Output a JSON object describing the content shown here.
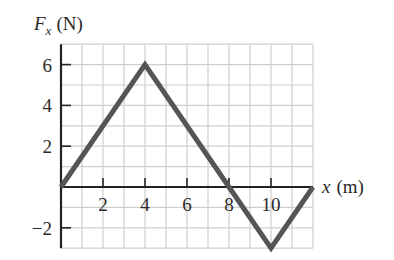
{
  "chart_data": {
    "type": "line",
    "title": "",
    "xlabel": "x (m)",
    "ylabel": "F_x (N)",
    "ylabel_main": "F",
    "ylabel_sub": "x",
    "ylabel_unit": "(N)",
    "xlabel_var": "x",
    "xlabel_unit": "(m)",
    "x": [
      0,
      4,
      8,
      10,
      12
    ],
    "series": [
      {
        "name": "F_x",
        "values": [
          0,
          6,
          0,
          -3,
          0
        ]
      }
    ],
    "xlim": [
      0,
      12
    ],
    "ylim": [
      -3,
      7
    ],
    "xticks": [
      2,
      4,
      6,
      8,
      10
    ],
    "xtick_labels": [
      "2",
      "4",
      "6",
      "8",
      "10"
    ],
    "yticks": [
      6,
      4,
      2,
      -2
    ],
    "ytick_labels": [
      "6",
      "4",
      "2",
      "−2"
    ],
    "grid": true,
    "grid_step": 1,
    "legend": null
  },
  "colors": {
    "line": "#555555",
    "axis": "#222222",
    "grid": "#cfcfcf",
    "text": "#2a2a2a"
  }
}
